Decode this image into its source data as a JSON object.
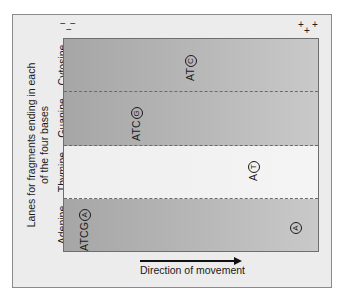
{
  "diagram": {
    "axis_title_line1": "Lanes for fragments ending in each",
    "axis_title_line2": "of the four bases",
    "negative_electrode": "−",
    "positive_electrode": "+",
    "direction_label": "Direction of movement",
    "colors": {
      "frame_bg": "#ececec",
      "gel_dark": "#a6a6a6",
      "gel_light": "#c9c9c9",
      "thymine_lane": "#f0f0f0",
      "text": "#1a1a1a"
    },
    "lanes": [
      {
        "name": "Cytosine",
        "band_prefix": "AT",
        "band_circled": "C"
      },
      {
        "name": "Guanine",
        "band_prefix": "ATC",
        "band_circled": "G"
      },
      {
        "name": "Thymine",
        "band_prefix": "A",
        "band_circled": "T"
      },
      {
        "name": "Adenine",
        "band_prefix": "ATCG",
        "band_circled": "A",
        "extra_band_prefix": "",
        "extra_band_circled": "A"
      }
    ]
  }
}
